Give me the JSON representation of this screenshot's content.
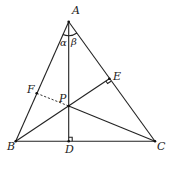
{
  "diagram": {
    "points": {
      "A": {
        "label": "A",
        "x": 68.7,
        "y": 21.7
      },
      "B": {
        "label": "B",
        "x": 15.7,
        "y": 141.3
      },
      "C": {
        "label": "C",
        "x": 155,
        "y": 141.3
      },
      "D": {
        "label": "D",
        "x": 68.7,
        "y": 141.3
      },
      "E": {
        "label": "E",
        "x": 109.3,
        "y": 78.7
      },
      "F": {
        "label": "F",
        "x": 36.7,
        "y": 93.3
      },
      "P": {
        "label": "P",
        "x": 68.7,
        "y": 106
      }
    },
    "angles": {
      "alpha": {
        "label": "α"
      },
      "beta": {
        "label": "β"
      }
    },
    "segments": [
      {
        "from": "A",
        "to": "B",
        "style": "solid"
      },
      {
        "from": "A",
        "to": "C",
        "style": "solid"
      },
      {
        "from": "B",
        "to": "C",
        "style": "solid"
      },
      {
        "from": "A",
        "to": "D",
        "style": "solid"
      },
      {
        "from": "B",
        "to": "E",
        "style": "solid"
      },
      {
        "from": "P",
        "to": "C",
        "style": "solid"
      },
      {
        "from": "F",
        "to": "P",
        "style": "dashed"
      }
    ],
    "right_angle_marks": [
      "D",
      "E"
    ]
  }
}
